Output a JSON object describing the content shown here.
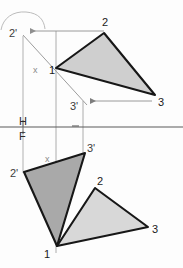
{
  "drawing": {
    "title": "Orthographic projection of triangle 1-2-3",
    "canvas": {
      "width": 183,
      "height": 268,
      "background": "#fdfdfd"
    },
    "colors": {
      "outline": "#171717",
      "construction": "#9a9a9a",
      "ground_line": "#555555",
      "fill_top": "#cfcfcf",
      "fill_front_dark": "#a9a9a9",
      "fill_front_light": "#d8d8d8",
      "label_dark": "#1a1a1a",
      "label_gray": "#8a8a8a"
    },
    "ground_line": {
      "name": "H-F reference line",
      "y": 127,
      "x_start": 0,
      "x_end": 183,
      "upper_label": "H",
      "lower_label": "F"
    },
    "shapes": [
      {
        "id": "top-view-triangle",
        "name": "Top view of triangle 1-2-3 (rotated / true shape)",
        "fill": "#cfcfcf",
        "stroke": "#171717",
        "points": "56,68 104,33 155,95"
      },
      {
        "id": "front-view-triangle-dark",
        "name": "Front view of triangle 1-2'-3' (edge rotated position)",
        "fill": "#a9a9a9",
        "stroke": "#171717",
        "points": "24,172 85,153 57,246"
      },
      {
        "id": "front-view-triangle-light",
        "name": "Front view of triangle 1-2-3 (original position)",
        "fill": "#d8d8d8",
        "stroke": "#171717",
        "points": "57,246 95,188 148,227"
      }
    ],
    "construction_lines": [
      {
        "name": "vertical-projector-vertex-1",
        "x1": 56,
        "y1": 31,
        "x2": 56,
        "y2": 253
      },
      {
        "name": "vertical-projector-3-prime",
        "x1": 83,
        "y1": 101,
        "x2": 83,
        "y2": 155
      },
      {
        "name": "vertical-projector-2-prime-top",
        "x1": 23,
        "y1": 36,
        "x2": 23,
        "y2": 127
      },
      {
        "name": "vertical-projector-2-prime-front",
        "x1": 23,
        "y1": 132,
        "x2": 23,
        "y2": 172
      },
      {
        "name": "rotation-axis-line",
        "x1": 23,
        "y1": 35,
        "x2": 86,
        "y2": 104
      },
      {
        "name": "horizontal-tie-vertex-2",
        "x1": 28,
        "y1": 31,
        "x2": 104,
        "y2": 31
      },
      {
        "name": "horizontal-tie-vertex-3",
        "x1": 88,
        "y1": 101,
        "x2": 152,
        "y2": 101
      }
    ],
    "arrows": [
      {
        "name": "arrow-to-2-prime",
        "x": 28,
        "y": 31,
        "direction": "left"
      },
      {
        "name": "arrow-to-3-prime",
        "x": 88,
        "y": 101,
        "direction": "left"
      },
      {
        "name": "arc-rotation-indicator",
        "path": "M 2,27 C 4,17 14,12 26,13 C 38,14 43,20 44,28"
      }
    ],
    "labels": [
      {
        "name": "label-2-prime-top",
        "text": "2'",
        "x": 9,
        "y": 37,
        "style": "prime"
      },
      {
        "name": "label-2-top",
        "text": "2",
        "x": 102,
        "y": 26,
        "style": "plain"
      },
      {
        "name": "label-1-top",
        "text": "1",
        "x": 49,
        "y": 74,
        "style": "plain"
      },
      {
        "name": "label-3-top",
        "text": "3",
        "x": 158,
        "y": 106,
        "style": "plain"
      },
      {
        "name": "label-3-prime-top",
        "text": "3'",
        "x": 71,
        "y": 110,
        "style": "prime"
      },
      {
        "name": "label-x-upper",
        "text": "x",
        "x": 33,
        "y": 73,
        "style": "axis"
      },
      {
        "name": "label-H",
        "text": "H",
        "x": 19,
        "y": 125,
        "style": "plane"
      },
      {
        "name": "label-F",
        "text": "F",
        "x": 19,
        "y": 140,
        "style": "plane"
      },
      {
        "name": "label-x-lower",
        "text": "x",
        "x": 45,
        "y": 162,
        "style": "axis"
      },
      {
        "name": "label-3-prime-front",
        "text": "3'",
        "x": 87,
        "y": 152,
        "style": "prime"
      },
      {
        "name": "label-2-prime-front",
        "text": "2'",
        "x": 11,
        "y": 177,
        "style": "prime"
      },
      {
        "name": "label-2-front",
        "text": "2",
        "x": 97,
        "y": 185,
        "style": "plain"
      },
      {
        "name": "label-3-front",
        "text": "3",
        "x": 152,
        "y": 233,
        "style": "plain"
      },
      {
        "name": "label-1-front",
        "text": "1",
        "x": 44,
        "y": 258,
        "style": "plain"
      }
    ]
  }
}
